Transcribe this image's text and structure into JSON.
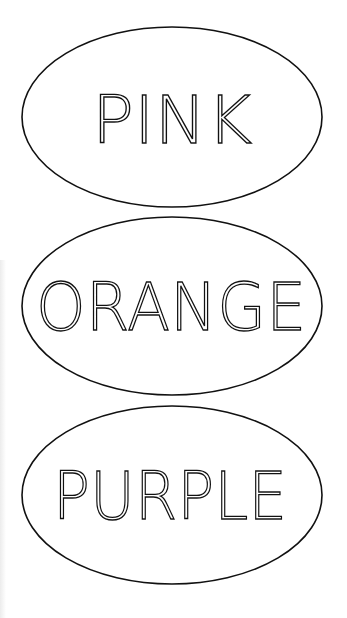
{
  "labels": [
    {
      "text": "PINK",
      "color_name": "pink"
    },
    {
      "text": "ORANGE",
      "color_name": "orange"
    },
    {
      "text": "PURPLE",
      "color_name": "purple"
    }
  ],
  "colors": {
    "background": "#ffffff",
    "stroke": "#111111"
  }
}
